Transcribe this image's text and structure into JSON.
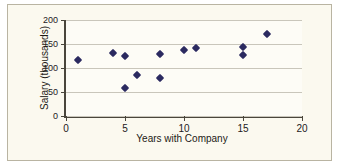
{
  "chart_data": {
    "type": "scatter",
    "title": "",
    "xlabel": "Years with Company",
    "ylabel": "Salary (thousands)",
    "xlim": [
      0,
      20
    ],
    "ylim": [
      0,
      200
    ],
    "xticks": [
      0,
      5,
      10,
      15,
      20
    ],
    "yticks": [
      0,
      50,
      100,
      150,
      200
    ],
    "xticklabels": [
      "0",
      "5",
      "10",
      "15",
      "20"
    ],
    "yticklabels": [
      "0",
      "50",
      "100",
      "150",
      "200"
    ],
    "grid": "horizontal",
    "legend": "none",
    "marker": "diamond",
    "marker_color": "#2b2a60",
    "background_color": "#fbf9ef",
    "points": [
      {
        "x": 1,
        "y": 116
      },
      {
        "x": 4,
        "y": 132
      },
      {
        "x": 5,
        "y": 125
      },
      {
        "x": 5,
        "y": 58
      },
      {
        "x": 6,
        "y": 86
      },
      {
        "x": 8,
        "y": 130
      },
      {
        "x": 8,
        "y": 79
      },
      {
        "x": 10,
        "y": 138
      },
      {
        "x": 11,
        "y": 142
      },
      {
        "x": 15,
        "y": 143
      },
      {
        "x": 15,
        "y": 128
      },
      {
        "x": 17,
        "y": 170
      }
    ]
  }
}
